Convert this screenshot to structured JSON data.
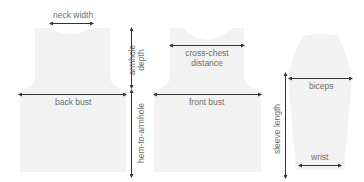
{
  "diagram": {
    "type": "knitting schematic",
    "colors": {
      "garment_fill": "#f2f2f2",
      "arrow": "#333333",
      "label": "#6e6e6e",
      "background": "#ffffff"
    },
    "pieces": [
      {
        "name": "back",
        "measurements": [
          "neck width",
          "armhole depth",
          "back bust",
          "hem-to-armhole"
        ]
      },
      {
        "name": "front",
        "measurements": [
          "cross-chest distance",
          "front bust"
        ]
      },
      {
        "name": "sleeve",
        "measurements": [
          "biceps",
          "sleeve length",
          "wrist"
        ]
      }
    ]
  },
  "labels": {
    "neck_width": "neck width",
    "armhole_line1": "armhole",
    "armhole_line2": "depth",
    "back_bust": "back bust",
    "hem_to_armhole": "hem-to-armhole",
    "cross_chest_line1": "cross-chest",
    "cross_chest_line2": "distance",
    "front_bust": "front bust",
    "biceps": "biceps",
    "sleeve_length": "sleeve length",
    "wrist": "wrist"
  }
}
